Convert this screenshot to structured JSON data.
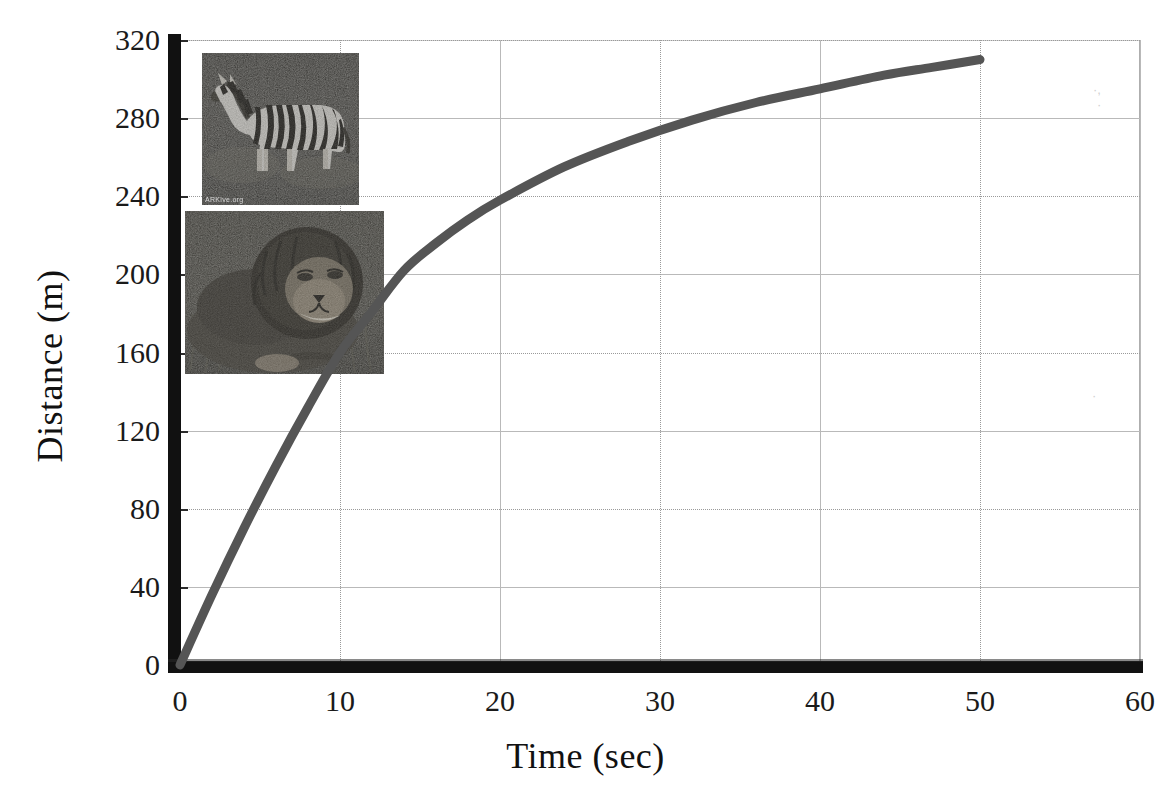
{
  "chart_data": {
    "type": "line",
    "title": "",
    "xlabel": "Time (sec)",
    "ylabel": "Distance (m)",
    "xlim": [
      0,
      60
    ],
    "ylim": [
      0,
      320
    ],
    "grid": true,
    "legend": "none",
    "x_ticks": [
      "0",
      "10",
      "20",
      "30",
      "40",
      "50",
      "60"
    ],
    "y_ticks": [
      "0",
      "40",
      "80",
      "120",
      "160",
      "200",
      "240",
      "280",
      "320"
    ],
    "x_tick_values": [
      0,
      10,
      20,
      30,
      40,
      50,
      60
    ],
    "y_tick_values": [
      0,
      40,
      80,
      120,
      160,
      200,
      240,
      280,
      320
    ],
    "series": [
      {
        "name": "Distance travelled",
        "color": "#555555",
        "line_width": 9,
        "x": [
          0,
          2,
          4,
          6,
          8,
          10,
          12,
          14,
          16,
          18,
          20,
          24,
          28,
          32,
          36,
          40,
          44,
          47,
          50
        ],
        "values": [
          0,
          36,
          70,
          102,
          132,
          160,
          181,
          202,
          216,
          228,
          238,
          255,
          268,
          279,
          288,
          295,
          302,
          306,
          310
        ]
      }
    ],
    "annotations": [
      {
        "name": "zebra-photo",
        "kind": "image",
        "subject": "zebra",
        "x_range": [
          1.4,
          11.2
        ],
        "y_range": [
          235,
          313
        ]
      },
      {
        "name": "lion-photo",
        "kind": "image",
        "subject": "lion",
        "x_range": [
          0.3,
          12.8
        ],
        "y_range": [
          149,
          232
        ]
      }
    ]
  },
  "axes": {
    "x_title": "Time (sec)",
    "y_title": "Distance (m)"
  },
  "photos": {
    "zebra": {
      "name": "zebra-photo",
      "alt": "Grayscale photograph of a zebra standing in grassland",
      "watermark": "ARKive.org"
    },
    "lion": {
      "name": "lion-photo",
      "alt": "Grayscale photograph of a male lion lying in grass",
      "watermark": ""
    }
  },
  "title_sliver": ""
}
